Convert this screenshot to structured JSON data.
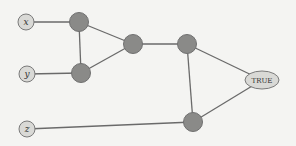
{
  "diagram": {
    "type": "boolean-circuit-graph",
    "colors": {
      "background": "#f4f4f2",
      "edge": "#6a6a6a",
      "input_fill": "#d9d9d6",
      "gate_fill": "#8a8a88",
      "output_fill": "#d9d9d6"
    },
    "nodes": [
      {
        "id": "x",
        "label": "x",
        "kind": "input",
        "cx": 26,
        "cy": 22
      },
      {
        "id": "y",
        "label": "y",
        "kind": "input",
        "cx": 27,
        "cy": 74
      },
      {
        "id": "z",
        "label": "z",
        "kind": "input",
        "cx": 27,
        "cy": 129
      },
      {
        "id": "g1",
        "label": "",
        "kind": "gate",
        "cx": 79,
        "cy": 22
      },
      {
        "id": "g2",
        "label": "",
        "kind": "gate",
        "cx": 81,
        "cy": 73
      },
      {
        "id": "g3",
        "label": "",
        "kind": "gate",
        "cx": 133,
        "cy": 44
      },
      {
        "id": "g4",
        "label": "",
        "kind": "gate",
        "cx": 187,
        "cy": 44
      },
      {
        "id": "g5",
        "label": "",
        "kind": "gate",
        "cx": 193,
        "cy": 122
      },
      {
        "id": "out",
        "label": "TRUE",
        "kind": "output",
        "cx": 262,
        "cy": 80
      }
    ],
    "edges": [
      [
        "x",
        "g1"
      ],
      [
        "g1",
        "g2"
      ],
      [
        "g1",
        "g3"
      ],
      [
        "y",
        "g2"
      ],
      [
        "g2",
        "g3"
      ],
      [
        "g3",
        "g4"
      ],
      [
        "g4",
        "out"
      ],
      [
        "g4",
        "g5"
      ],
      [
        "g5",
        "out"
      ],
      [
        "z",
        "g5"
      ]
    ]
  }
}
